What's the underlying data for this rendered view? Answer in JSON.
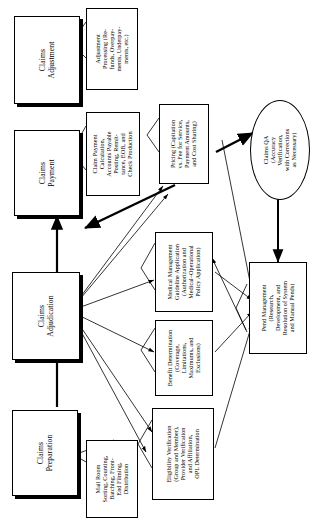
{
  "diagram": {
    "orientation": "rotated-90",
    "process_boxes": [
      {
        "id": "claims-adjustment",
        "label": "Claims\nAdjustment"
      },
      {
        "id": "claims-payment",
        "label": "Claims\nPayment"
      },
      {
        "id": "claims-adjudication",
        "label": "Claims\nAdjudication"
      },
      {
        "id": "claims-preparation",
        "label": "Claims\nPreparation"
      }
    ],
    "annotation_boxes": [
      {
        "id": "adjustment-processing",
        "label": "Adjustment\nProcessing (Re-\nfunds, Overpay-\nments, Underpay-\nments, etc.)"
      },
      {
        "id": "claim-payment-calculation",
        "label": "Claim Payment\nCalculation,\nAccounts Payable\nPosting, Remit-\ntance, EOB, and\nCheck Production"
      },
      {
        "id": "pricing-capitation",
        "label": "Pricing (Capitation\nvs. Fee for Service,\nPayment Amounts,\nand Cost Sharing)"
      },
      {
        "id": "medical-management",
        "label": "Medical Management\nGuideline Application\n(Authorization and\nMedical–Operational\nPolicy Application)"
      },
      {
        "id": "benefit-determination",
        "label": "Benefit Determination\n(Coverage,\nLimitations,\nMaximums, and\nExclusions)"
      },
      {
        "id": "eligibility-verification",
        "label": "Eligibility Verification\n(Group and Member),\nProvider Verification\nand Affiliation,\nOPL Determination"
      },
      {
        "id": "pend-management",
        "label": "Pend Management\n(Research,\nDevelopment, and\nResolution of System\nand Manual Pends)"
      },
      {
        "id": "mail-room",
        "label": "Mail Room\nSorting, Counting,\nBatching, Front-\nEnd Filming,\nDistribution"
      }
    ],
    "oval_nodes": [
      {
        "id": "claims-qa",
        "label": "Claims QA\n(Accuracy\nVerification,\nwith Corrections\nas Necessary)"
      }
    ],
    "colors": {
      "line": "#000000",
      "fill": "#ffffff",
      "shadow": "#000000"
    }
  }
}
